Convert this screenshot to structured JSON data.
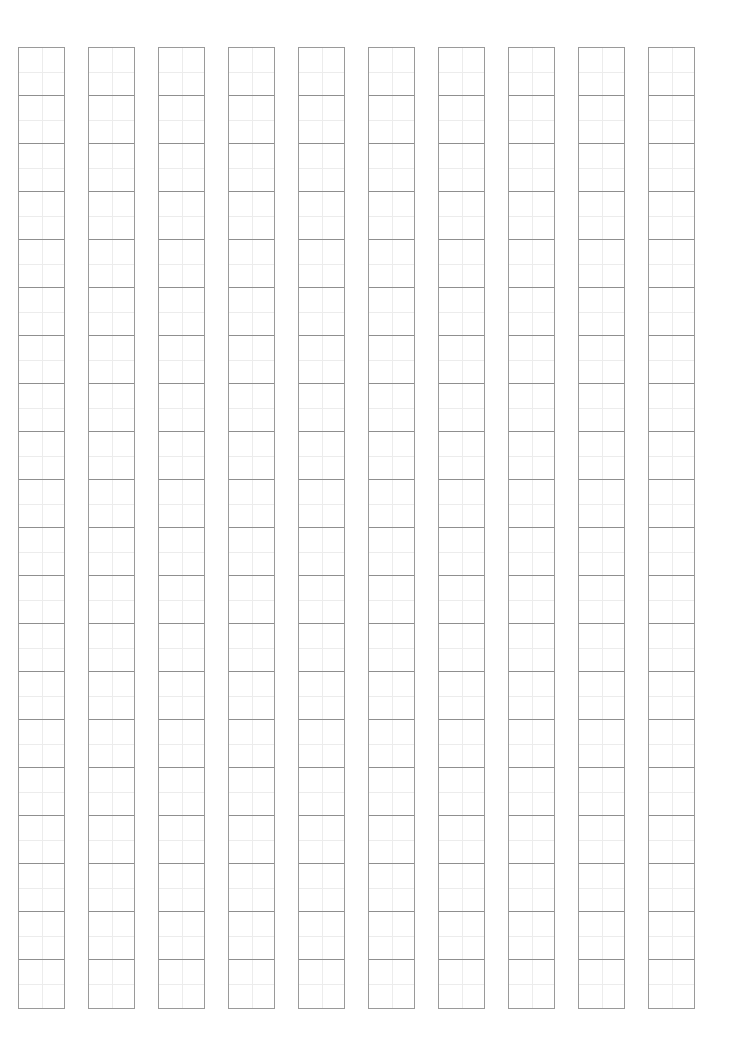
{
  "sheet": {
    "type": "writing-practice-grid",
    "columns": 10,
    "rows": 20,
    "column_left_positions": [
      18,
      88,
      158,
      228,
      298,
      368,
      438,
      508,
      578,
      648
    ],
    "colors": {
      "outer_border": "#9a9a9a",
      "cell_divider": "#8f8f8f",
      "guide_line": "#ececec",
      "background": "#ffffff"
    }
  }
}
